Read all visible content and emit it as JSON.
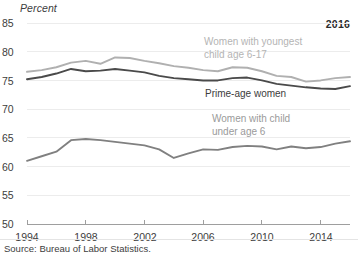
{
  "chart_data": {
    "type": "line",
    "title": "",
    "subtitle": "",
    "xlabel": "",
    "ylabel": "Percent",
    "ylim": [
      50,
      85
    ],
    "xlim": [
      1994,
      2016
    ],
    "ytick_step": 5,
    "yticks": [
      "85",
      "80",
      "75",
      "70",
      "65",
      "60",
      "55",
      "50"
    ],
    "xticks": [
      "1994",
      "1998",
      "2002",
      "2006",
      "2010",
      "2014"
    ],
    "grid": "horizontal",
    "legend_position": "inline-annotations",
    "corner_annotation": "2016",
    "source": "Source: Bureau of Labor Statistics.",
    "x": [
      1994,
      1995,
      1996,
      1997,
      1998,
      1999,
      2000,
      2001,
      2002,
      2003,
      2004,
      2005,
      2006,
      2007,
      2008,
      2009,
      2010,
      2011,
      2012,
      2013,
      2014,
      2015,
      2016
    ],
    "series": [
      {
        "name": "Women with youngest child age 6-17",
        "label_line1": "Women with youngest",
        "label_line2": "child age 6-17",
        "color": "#b0b0b0",
        "values": [
          76.5,
          76.8,
          77.3,
          78.1,
          78.4,
          77.9,
          79.0,
          78.9,
          78.4,
          78.0,
          77.5,
          77.2,
          76.8,
          76.6,
          77.3,
          77.2,
          76.6,
          75.8,
          75.6,
          74.8,
          75.0,
          75.4,
          75.6
        ]
      },
      {
        "name": "Prime-age women",
        "label_line1": "Prime-age women",
        "label_line2": "",
        "color": "#4a4a4a",
        "values": [
          75.2,
          75.6,
          76.2,
          77.0,
          76.6,
          76.7,
          77.0,
          76.7,
          76.4,
          75.8,
          75.4,
          75.2,
          75.0,
          75.0,
          75.4,
          75.5,
          75.0,
          74.4,
          74.1,
          73.8,
          73.6,
          73.5,
          74.0
        ]
      },
      {
        "name": "Women with child under age 6",
        "label_line1": "Women with child",
        "label_line2": "under age 6",
        "color": "#808080",
        "values": [
          61.0,
          61.8,
          62.6,
          64.6,
          64.8,
          64.6,
          64.3,
          64.0,
          63.7,
          63.0,
          61.5,
          62.3,
          63.0,
          62.9,
          63.4,
          63.6,
          63.5,
          63.0,
          63.5,
          63.2,
          63.4,
          64.0,
          64.4
        ]
      }
    ]
  }
}
